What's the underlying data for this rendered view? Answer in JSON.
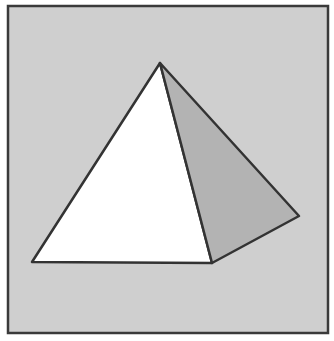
{
  "diagram": {
    "title": "",
    "colors": {
      "page_background": "#ffffff",
      "panel_fill": "#cfcfcf",
      "panel_border": "#3a3a3a",
      "front_face": "#ffffff",
      "side_face": "#b3b3b3",
      "edge_stroke": "#333333"
    },
    "panel": {
      "x": 8,
      "y": 6,
      "width": 320,
      "height": 327
    },
    "vertices": {
      "apex": [
        160,
        63
      ],
      "base_left": [
        32,
        262
      ],
      "base_front_right": [
        212,
        263
      ],
      "base_back_right": [
        299,
        216
      ]
    }
  }
}
